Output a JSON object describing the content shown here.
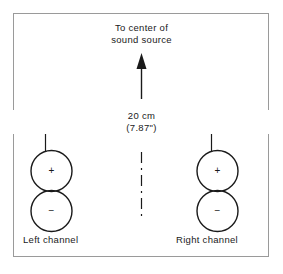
{
  "figure": {
    "title_lines": {
      "line1": "To center of",
      "line2": "sound source"
    },
    "dimension": {
      "metric": "20 cm",
      "imperial": "(7.87\")"
    },
    "channels": [
      {
        "label": "Left channel",
        "positive": "+",
        "negative": "−"
      },
      {
        "label": "Right channel",
        "positive": "+",
        "negative": "−"
      }
    ],
    "colors": {
      "ink": "#1a1a1a",
      "frame": "#9a9a9a",
      "background": "#ffffff"
    }
  }
}
